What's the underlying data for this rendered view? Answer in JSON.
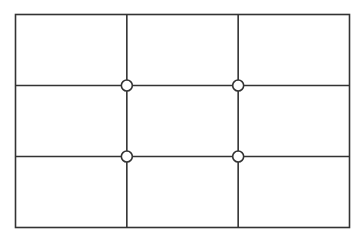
{
  "diagram": {
    "name": "rule-of-thirds-grid",
    "rows": 3,
    "columns": 3,
    "intersections": [
      {
        "row": 1,
        "col": 1
      },
      {
        "row": 1,
        "col": 2
      },
      {
        "row": 2,
        "col": 1
      },
      {
        "row": 2,
        "col": 2
      }
    ],
    "colors": {
      "line": "#333333",
      "marker_fill": "#ffffff",
      "background": "#ffffff"
    }
  }
}
